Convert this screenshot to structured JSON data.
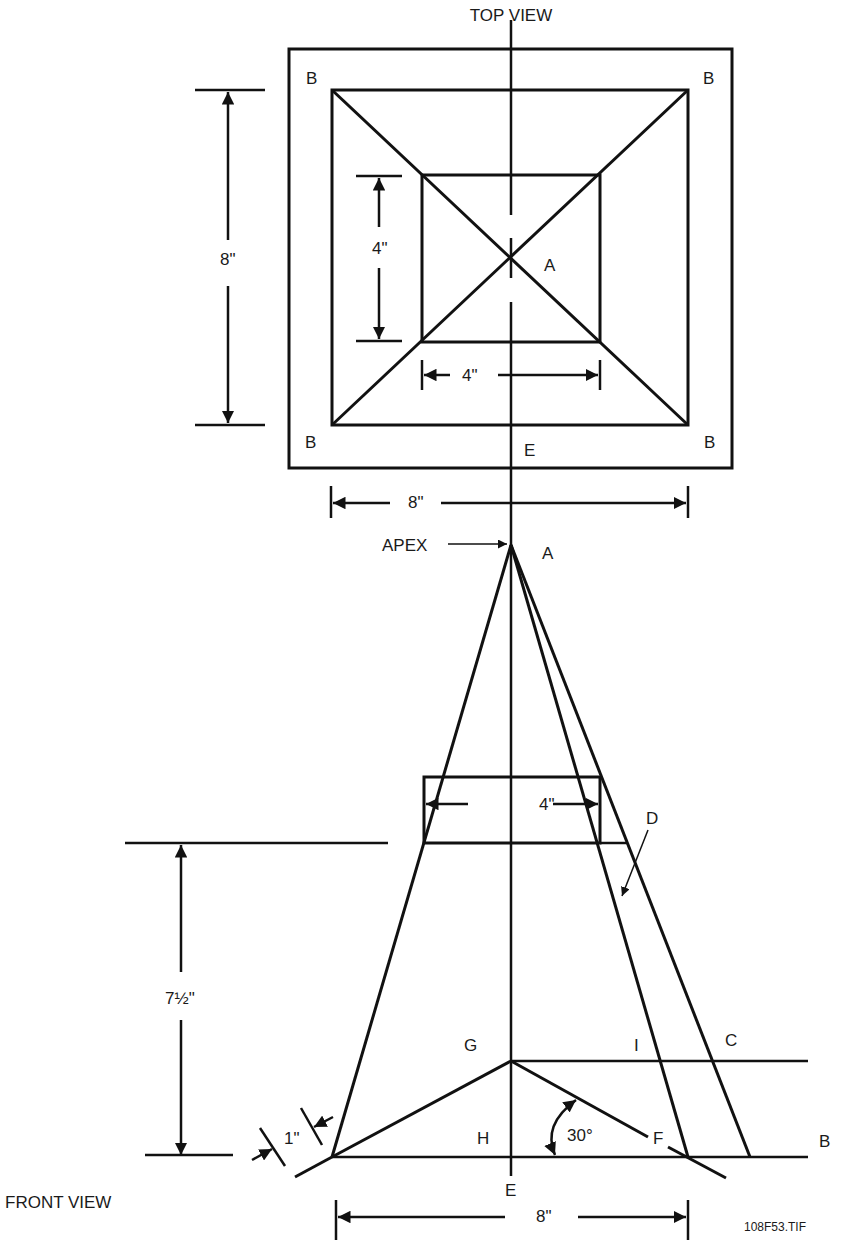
{
  "titles": {
    "top_view": "TOP VIEW",
    "front_view": "FRONT VIEW"
  },
  "file_tag": "108F53.TIF",
  "top_view": {
    "corner_labels": [
      "B",
      "B",
      "B",
      "B"
    ],
    "center_label": "A",
    "bottom_center_label": "E",
    "dimensions": {
      "outer_height": "8\"",
      "outer_width": "8\"",
      "inner_height": "4\"",
      "inner_width": "4\""
    }
  },
  "front_view": {
    "apex_callout": "APEX",
    "apex_label": "A",
    "labels": {
      "D": "D",
      "C": "C",
      "I": "I",
      "G": "G",
      "H": "H",
      "F": "F",
      "B": "B",
      "E": "E"
    },
    "dimensions": {
      "top_width": "4\"",
      "height": "7½\"",
      "flange": "1\"",
      "angle": "30°",
      "base_width": "8\""
    }
  },
  "colors": {
    "ink": "#111111",
    "background": "#ffffff"
  }
}
